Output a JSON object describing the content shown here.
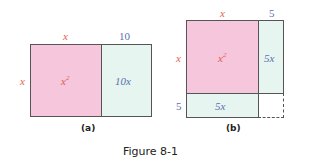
{
  "figure": {
    "title": "Figure 8-1",
    "colors": {
      "square": "#f5c6dc",
      "strip": "#e6f5ef",
      "border": "#555555",
      "x_label": "#e0604a",
      "num_label": "#5c6fb0"
    },
    "panel_a": {
      "caption": "(a)",
      "top_x": "x",
      "top_10": "10",
      "left_x": "x",
      "square_base": "x",
      "square_exp": "2",
      "strip_label": "10x"
    },
    "panel_b": {
      "caption": "(b)",
      "top_x": "x",
      "top_5": "5",
      "left_x": "x",
      "left_5": "5",
      "square_base": "x",
      "square_exp": "2",
      "right_strip_label": "5x",
      "bottom_strip_label": "5x"
    }
  }
}
